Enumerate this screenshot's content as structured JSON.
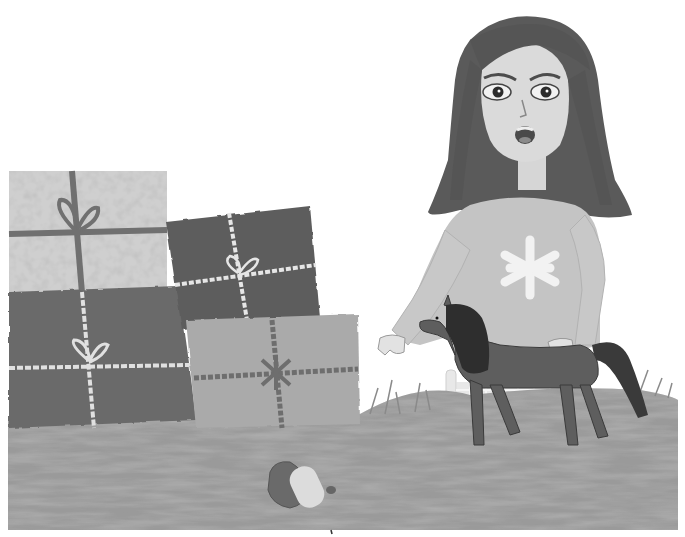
{
  "scene": {
    "description": "Grayscale illustration of a surprised girl in a sweater pointing down at a fallen hat, next to stacked wrapped gifts and a toy horse on grass",
    "colors": {
      "background": "#ffffff",
      "grass": "#9a9a9a",
      "grass_dark": "#7e7e7e",
      "hair": "#5a5a5a",
      "skin": "#d6d6d6",
      "sweater": "#c4c4c4",
      "snowflake": "#f0f0f0",
      "horse": "#5e5e5e",
      "horse_mane": "#2e2e2e",
      "gift_speckled": "#bdbdbd",
      "gift_dark_top": "#5d5d5d",
      "gift_dark_bottom": "#6a6a6a",
      "gift_light": "#a9a9a9",
      "ribbon_dark": "#707070",
      "ribbon_light": "#e6e6e6",
      "hat": "#6a6a6a",
      "hat_band": "#dcdcdc"
    },
    "elements": {
      "girl": "girl",
      "gifts": [
        "speckled gift",
        "dark gift top",
        "dark gift bottom",
        "light gift"
      ],
      "horse": "toy horse",
      "hat": "fallen hat",
      "fence": "fence"
    }
  }
}
